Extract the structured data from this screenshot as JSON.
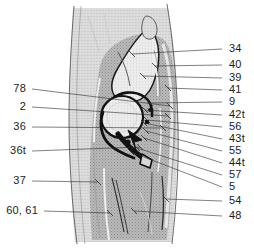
{
  "figure": {
    "kind": "anatomical-illustration",
    "colors": {
      "background": "#ffffff",
      "soft_tissue_fill": "#b4b4b4",
      "soft_tissue_light": "#d6d6d6",
      "bone_fill": "#e9e9e9",
      "outline": "#1c1c1c",
      "leader_line": "#2b2b2b",
      "label_text": "#1c1c1c",
      "skin_line": "#6a6a6a"
    }
  },
  "labels": {
    "left": [
      {
        "id": "78",
        "text": "78",
        "x": 26,
        "y": 92,
        "tip_x": 170,
        "tip_y": 106
      },
      {
        "id": "2",
        "text": "2",
        "x": 26,
        "y": 110,
        "tip_x": 168,
        "tip_y": 116
      },
      {
        "id": "36",
        "text": "36",
        "x": 26,
        "y": 130,
        "tip_x": 163,
        "tip_y": 128
      },
      {
        "id": "36t",
        "text": "36t",
        "x": 26,
        "y": 154,
        "tip_x": 140,
        "tip_y": 147
      },
      {
        "id": "37",
        "text": "37",
        "x": 26,
        "y": 184,
        "tip_x": 98,
        "tip_y": 182
      },
      {
        "id": "60, 61",
        "text": "60, 61",
        "x": 38,
        "y": 214,
        "tip_x": 110,
        "tip_y": 213
      }
    ],
    "right": [
      {
        "id": "34",
        "text": "34",
        "x": 229,
        "y": 52,
        "tip_x": 132,
        "tip_y": 54
      },
      {
        "id": "40",
        "text": "40",
        "x": 229,
        "y": 68,
        "tip_x": 155,
        "tip_y": 66
      },
      {
        "id": "39",
        "text": "39",
        "x": 229,
        "y": 81,
        "tip_x": 143,
        "tip_y": 76
      },
      {
        "id": "41",
        "text": "41",
        "x": 229,
        "y": 93,
        "tip_x": 168,
        "tip_y": 88
      },
      {
        "id": "9",
        "text": "9",
        "x": 229,
        "y": 105,
        "tip_x": 150,
        "tip_y": 103
      },
      {
        "id": "42t",
        "text": "42t",
        "x": 229,
        "y": 118,
        "tip_x": 145,
        "tip_y": 110
      },
      {
        "id": "56",
        "text": "56",
        "x": 229,
        "y": 130,
        "tip_x": 147,
        "tip_y": 120
      },
      {
        "id": "43t",
        "text": "43t",
        "x": 229,
        "y": 142,
        "tip_x": 144,
        "tip_y": 123
      },
      {
        "id": "55",
        "text": "55",
        "x": 229,
        "y": 154,
        "tip_x": 146,
        "tip_y": 131
      },
      {
        "id": "44t",
        "text": "44t",
        "x": 229,
        "y": 166,
        "tip_x": 144,
        "tip_y": 138
      },
      {
        "id": "57",
        "text": "57",
        "x": 229,
        "y": 178,
        "tip_x": 137,
        "tip_y": 148
      },
      {
        "id": "5",
        "text": "5",
        "x": 229,
        "y": 190,
        "tip_x": 131,
        "tip_y": 152
      },
      {
        "id": "54",
        "text": "54",
        "x": 229,
        "y": 204,
        "tip_x": 166,
        "tip_y": 199
      },
      {
        "id": "48",
        "text": "48",
        "x": 229,
        "y": 219,
        "tip_x": 134,
        "tip_y": 211
      }
    ]
  }
}
